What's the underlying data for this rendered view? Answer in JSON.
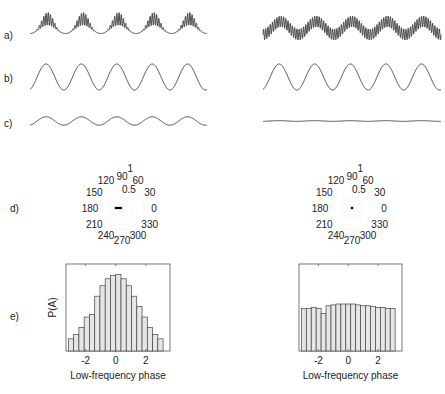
{
  "figure": {
    "row_labels": [
      "a)",
      "b)",
      "c)",
      "d)",
      "e)"
    ]
  },
  "chart_data": [
    {
      "type": "line",
      "panel": "a-left",
      "description": "High-frequency oscillation whose amplitude is modulated by the low-frequency phase (coupled)",
      "low_freq_cycles": 5,
      "high_freq_cycles_per_low_cycle": 10,
      "coupled": true
    },
    {
      "type": "line",
      "panel": "a-right",
      "description": "High-frequency oscillation riding on low-frequency wave, constant amplitude (uncoupled)",
      "low_freq_cycles": 5,
      "high_freq_cycles_per_low_cycle": 10,
      "coupled": false
    },
    {
      "type": "line",
      "panel": "b-left",
      "description": "Low-frequency component",
      "cycles": 5,
      "amplitude": 1.0
    },
    {
      "type": "line",
      "panel": "b-right",
      "description": "Low-frequency component",
      "cycles": 5,
      "amplitude": 1.0
    },
    {
      "type": "line",
      "panel": "c-left",
      "description": "High-frequency amplitude envelope",
      "cycles": 5,
      "amplitude": 0.35
    },
    {
      "type": "line",
      "panel": "c-right",
      "description": "High-frequency amplitude envelope (flat)",
      "cycles": 5,
      "amplitude": 0.03
    },
    {
      "type": "polar",
      "panel": "d-left",
      "angle_ticks": [
        "0",
        "30",
        "60",
        "90",
        "120",
        "150",
        "180",
        "210",
        "240",
        "270",
        "300",
        "330"
      ],
      "radial_ticks": [
        "0.5",
        "1"
      ],
      "rlim": [
        0,
        1
      ],
      "vector": {
        "angle_deg": 180,
        "length": 0.15
      }
    },
    {
      "type": "polar",
      "panel": "d-right",
      "angle_ticks": [
        "0",
        "30",
        "60",
        "90",
        "120",
        "150",
        "180",
        "210",
        "240",
        "270",
        "300",
        "330"
      ],
      "radial_ticks": [
        "0.5",
        "1"
      ],
      "rlim": [
        0,
        1
      ],
      "vector": {
        "angle_deg": 0,
        "length": 0.01
      }
    },
    {
      "type": "bar",
      "panel": "e-left",
      "xlabel": "Low-frequency phase",
      "ylabel": "P(A)",
      "xlim": [
        -3.3,
        3.6
      ],
      "ylim": [
        0,
        1
      ],
      "xticks": [
        -2,
        0,
        2
      ],
      "xtick_labels": [
        "-2",
        "0",
        "2"
      ],
      "bin_range": [
        -3.1416,
        3.1416
      ],
      "values": [
        0.14,
        0.19,
        0.27,
        0.39,
        0.42,
        0.63,
        0.75,
        0.83,
        0.87,
        0.88,
        0.83,
        0.75,
        0.63,
        0.51,
        0.39,
        0.27,
        0.19,
        0.14
      ]
    },
    {
      "type": "bar",
      "panel": "e-right",
      "xlabel": "Low-frequency phase",
      "ylabel": "",
      "xlim": [
        -3.3,
        3.6
      ],
      "ylim": [
        0,
        1
      ],
      "xticks": [
        -2,
        0,
        2
      ],
      "xtick_labels": [
        "-2",
        "0",
        "2"
      ],
      "bin_range": [
        -3.1416,
        3.1416
      ],
      "values": [
        0.49,
        0.49,
        0.5,
        0.49,
        0.43,
        0.52,
        0.53,
        0.54,
        0.54,
        0.54,
        0.54,
        0.53,
        0.52,
        0.52,
        0.51,
        0.5,
        0.5,
        0.49,
        0.49
      ]
    }
  ],
  "colors": {
    "line": "#333333",
    "bar_fill": "#e6e6e6",
    "bar_stroke": "#444444",
    "polar_grid": "#e4e4e4"
  }
}
